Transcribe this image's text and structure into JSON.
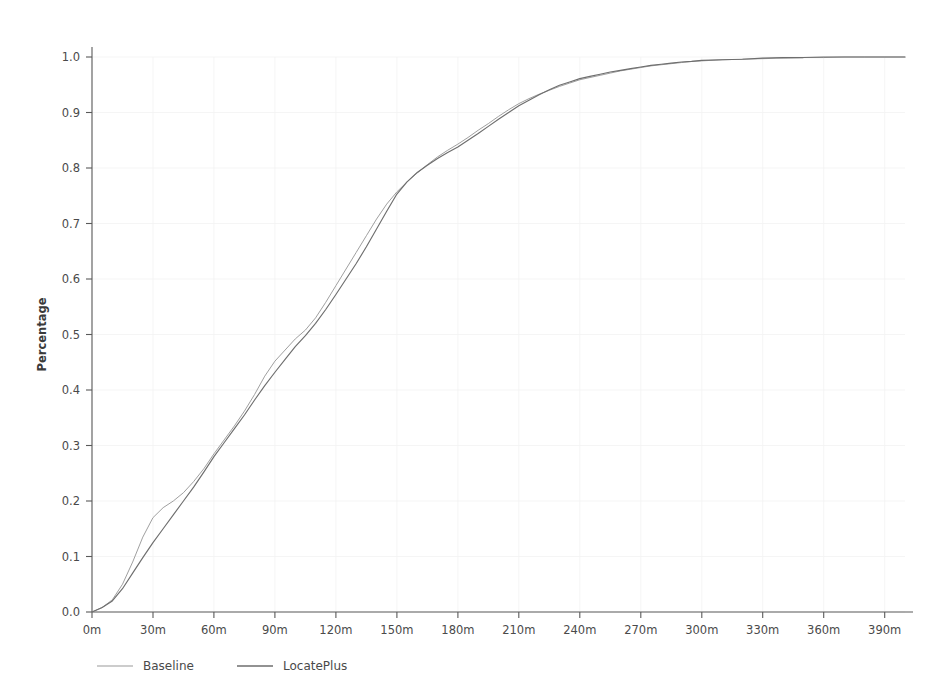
{
  "chart_data": {
    "type": "line",
    "title": "",
    "subtitle": "",
    "xlabel": "",
    "ylabel": "Percentage",
    "xlim": [
      0,
      400
    ],
    "ylim": [
      0,
      1.0
    ],
    "grid": true,
    "legend_position": "bottom-left",
    "x_unit": "m",
    "x_tick_labels": [
      "0m",
      "30m",
      "60m",
      "90m",
      "120m",
      "150m",
      "180m",
      "210m",
      "240m",
      "270m",
      "300m",
      "330m",
      "360m",
      "390m"
    ],
    "x_tick_values": [
      0,
      30,
      60,
      90,
      120,
      150,
      180,
      210,
      240,
      270,
      300,
      330,
      360,
      390
    ],
    "y_tick_labels": [
      "0.0",
      "0.1",
      "0.2",
      "0.3",
      "0.4",
      "0.5",
      "0.6",
      "0.7",
      "0.8",
      "0.9",
      "1.0"
    ],
    "y_tick_values": [
      0.0,
      0.1,
      0.2,
      0.3,
      0.4,
      0.5,
      0.6,
      0.7,
      0.8,
      0.9,
      1.0
    ],
    "x": [
      0,
      5,
      10,
      15,
      20,
      25,
      30,
      35,
      40,
      45,
      50,
      55,
      60,
      65,
      70,
      75,
      80,
      85,
      90,
      95,
      100,
      105,
      110,
      115,
      120,
      125,
      130,
      135,
      140,
      145,
      150,
      155,
      160,
      165,
      170,
      175,
      180,
      185,
      190,
      195,
      200,
      205,
      210,
      215,
      220,
      225,
      230,
      235,
      240,
      245,
      250,
      255,
      260,
      265,
      270,
      275,
      280,
      285,
      290,
      295,
      300,
      310,
      320,
      330,
      340,
      350,
      360,
      370,
      380,
      390,
      400
    ],
    "series": [
      {
        "name": "Baseline",
        "color": "#9a9a9a",
        "values": [
          0.0,
          0.008,
          0.022,
          0.05,
          0.09,
          0.135,
          0.17,
          0.188,
          0.2,
          0.215,
          0.235,
          0.258,
          0.285,
          0.31,
          0.335,
          0.362,
          0.392,
          0.425,
          0.452,
          0.472,
          0.492,
          0.508,
          0.53,
          0.558,
          0.588,
          0.618,
          0.648,
          0.678,
          0.708,
          0.735,
          0.757,
          0.775,
          0.791,
          0.806,
          0.82,
          0.832,
          0.843,
          0.855,
          0.868,
          0.88,
          0.893,
          0.905,
          0.916,
          0.925,
          0.933,
          0.94,
          0.947,
          0.953,
          0.959,
          0.963,
          0.967,
          0.971,
          0.975,
          0.978,
          0.981,
          0.984,
          0.986,
          0.988,
          0.99,
          0.992,
          0.993,
          0.995,
          0.996,
          0.997,
          0.998,
          0.999,
          0.999,
          1.0,
          1.0,
          1.0,
          1.0
        ]
      },
      {
        "name": "LocatePlus",
        "color": "#6e6e6e",
        "values": [
          0.0,
          0.008,
          0.02,
          0.042,
          0.07,
          0.098,
          0.125,
          0.15,
          0.175,
          0.2,
          0.225,
          0.252,
          0.28,
          0.305,
          0.33,
          0.355,
          0.382,
          0.408,
          0.432,
          0.455,
          0.478,
          0.498,
          0.52,
          0.545,
          0.572,
          0.6,
          0.628,
          0.658,
          0.69,
          0.722,
          0.753,
          0.775,
          0.792,
          0.805,
          0.817,
          0.828,
          0.838,
          0.85,
          0.862,
          0.875,
          0.888,
          0.9,
          0.912,
          0.922,
          0.932,
          0.941,
          0.949,
          0.955,
          0.961,
          0.965,
          0.969,
          0.973,
          0.976,
          0.979,
          0.982,
          0.985,
          0.987,
          0.989,
          0.991,
          0.992,
          0.994,
          0.995,
          0.996,
          0.998,
          0.999,
          0.999,
          1.0,
          1.0,
          1.0,
          1.0,
          1.0
        ]
      }
    ],
    "legend": [
      {
        "label": "Baseline",
        "color": "#9a9a9a"
      },
      {
        "label": "LocatePlus",
        "color": "#6e6e6e"
      }
    ],
    "axis_color": "#5a5a5a",
    "grid_color": "#f2f2f2",
    "background_color": "#ffffff"
  }
}
